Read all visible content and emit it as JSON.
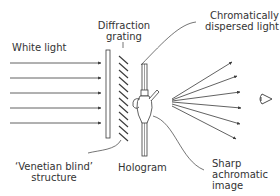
{
  "labels": {
    "white_light": "White light",
    "diffraction_grating_line1": "Diffraction",
    "diffraction_grating_line2": "grating",
    "chromatic_line1": "Chromatically",
    "chromatic_line2": "dispersed light",
    "venetian_line1": "‘Venetian blind’",
    "venetian_line2": "structure",
    "hologram": "Hologram",
    "sharp_line1": "Sharp",
    "sharp_line2": "achromatic",
    "sharp_line3": "image"
  },
  "colors": {
    "stroke": "#3a3a3a",
    "text": "#333333",
    "background": "#ffffff"
  }
}
